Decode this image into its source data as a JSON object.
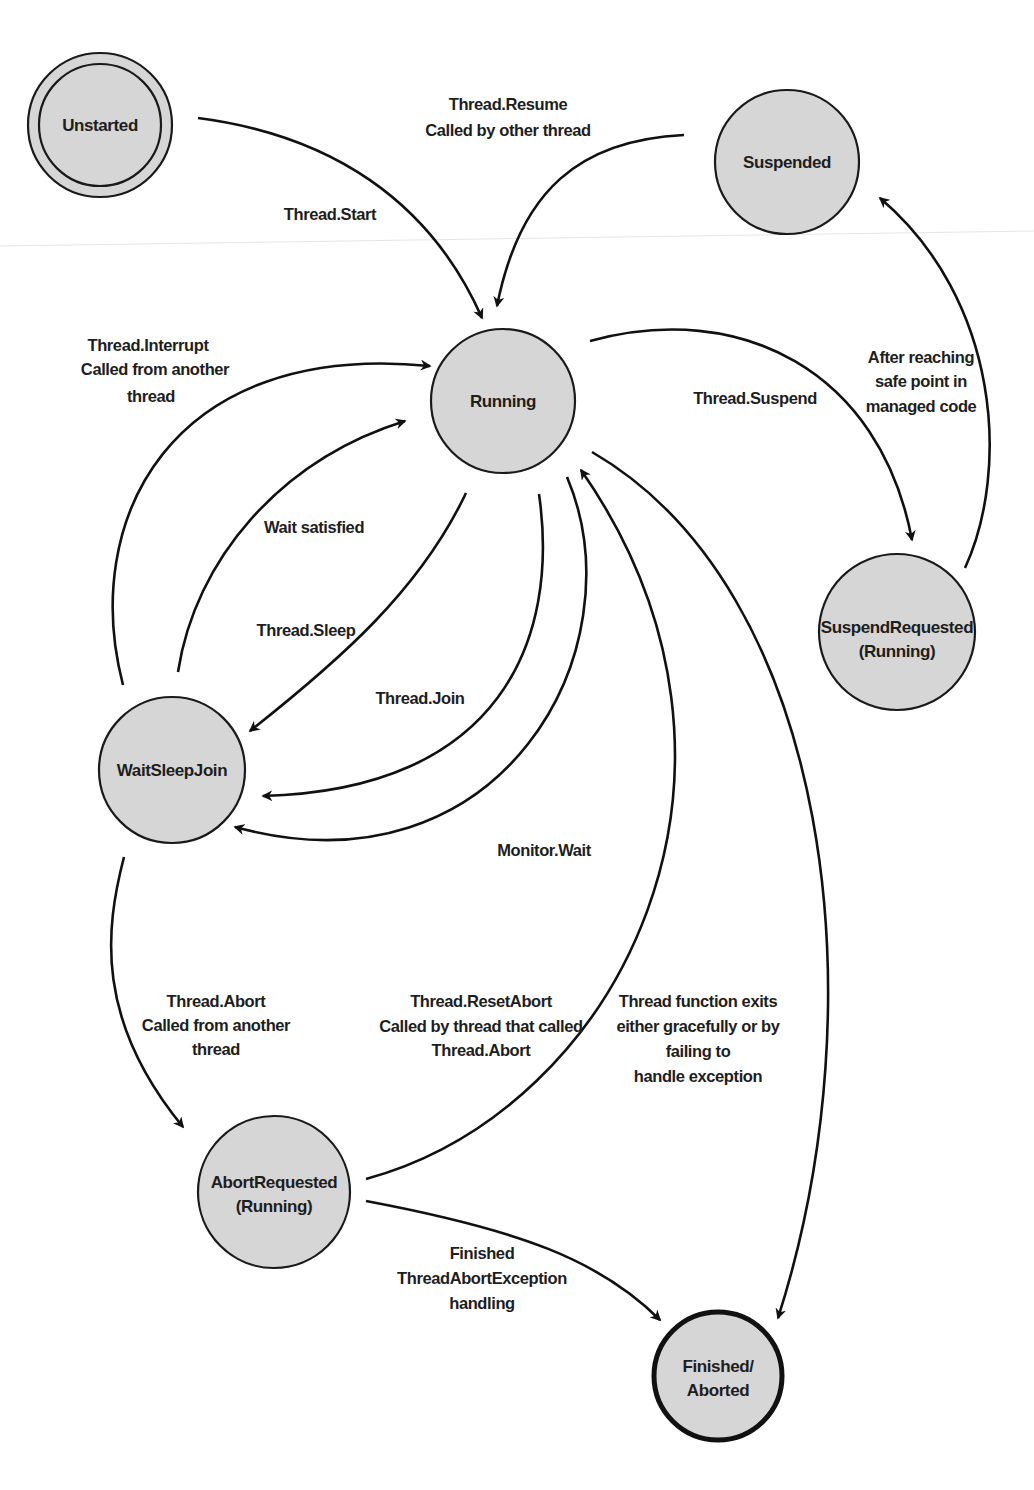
{
  "diagram": {
    "colors": {
      "node_fill": "#d6d6d6",
      "stroke": "#111111",
      "text": "#1e1e1e",
      "background": "#ffffff"
    },
    "nodes": [
      {
        "id": "unstarted",
        "lines": [
          "Unstarted"
        ],
        "style": "double-border"
      },
      {
        "id": "suspended",
        "lines": [
          "Suspended"
        ],
        "style": "normal"
      },
      {
        "id": "running",
        "lines": [
          "Running"
        ],
        "style": "normal"
      },
      {
        "id": "suspend_requested",
        "lines": [
          "SuspendRequested",
          "(Running)"
        ],
        "style": "normal"
      },
      {
        "id": "wait_sleep_join",
        "lines": [
          "WaitSleepJoin"
        ],
        "style": "normal"
      },
      {
        "id": "abort_requested",
        "lines": [
          "AbortRequested",
          "(Running)"
        ],
        "style": "normal"
      },
      {
        "id": "finished_aborted",
        "lines": [
          "Finished/",
          "Aborted"
        ],
        "style": "thick-border"
      }
    ],
    "edges": [
      {
        "from": "unstarted",
        "to": "running",
        "label": [
          "Thread.Start"
        ]
      },
      {
        "from": "suspended",
        "to": "running",
        "label": [
          "Thread.Resume",
          "Called by other thread"
        ]
      },
      {
        "from": "running",
        "to": "suspend_requested",
        "label": [
          "Thread.Suspend"
        ]
      },
      {
        "from": "suspend_requested",
        "to": "suspended",
        "label": [
          "After reaching",
          "safe point in",
          "managed code"
        ]
      },
      {
        "from": "wait_sleep_join",
        "to": "running",
        "label": [
          "Thread.Interrupt",
          "Called from another",
          "thread"
        ]
      },
      {
        "from": "wait_sleep_join",
        "to": "running",
        "label": [
          "Wait satisfied"
        ]
      },
      {
        "from": "running",
        "to": "wait_sleep_join",
        "label": [
          "Thread.Sleep"
        ]
      },
      {
        "from": "running",
        "to": "wait_sleep_join",
        "label": [
          "Thread.Join"
        ]
      },
      {
        "from": "running",
        "to": "wait_sleep_join",
        "label": [
          "Monitor.Wait"
        ]
      },
      {
        "from": "wait_sleep_join",
        "to": "abort_requested",
        "label": [
          "Thread.Abort",
          "Called from another",
          "thread"
        ]
      },
      {
        "from": "abort_requested",
        "to": "running",
        "label": [
          "Thread.ResetAbort",
          "Called by thread that called",
          "Thread.Abort"
        ]
      },
      {
        "from": "running",
        "to": "finished_aborted",
        "label": [
          "Thread function exits",
          "either gracefully or by",
          "failing to",
          "handle exception"
        ]
      },
      {
        "from": "abort_requested",
        "to": "finished_aborted",
        "label": [
          "Finished",
          "ThreadAbortException",
          "handling"
        ]
      }
    ]
  }
}
